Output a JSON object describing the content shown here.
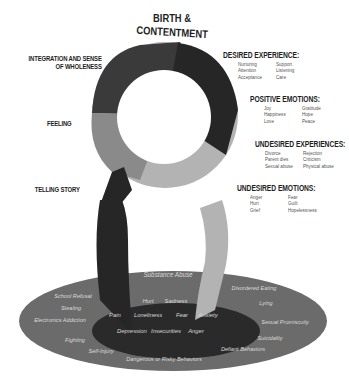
{
  "title": {
    "line1": "BIRTH &",
    "line2": "CONTENTMENT"
  },
  "left_labels": {
    "integration_line1": "INTEGRATION AND SENSE",
    "integration_line2": "OF WHOLENESS",
    "feeling": "FEELING",
    "telling_story": "TELLING STORY"
  },
  "sections": [
    {
      "heading": "DESIRED EXPERIENCE:",
      "items": [
        "Nurturing",
        "Support",
        "Attention",
        "Listening",
        "Acceptance",
        "Care"
      ]
    },
    {
      "heading": "POSITIVE EMOTIONS:",
      "items": [
        "Joy",
        "Gratitude",
        "Happiness",
        "Hope",
        "Love",
        "Peace"
      ]
    },
    {
      "heading": "UNDESIRED EXPERIENCES:",
      "items": [
        "Divorce",
        "Rejection",
        "Parent dies",
        "Criticism",
        "Sexual abuse",
        "Physical abuse"
      ]
    },
    {
      "heading": "UNDESIRED EMOTIONS:",
      "items": [
        "Anger",
        "Fear",
        "Hurt",
        "Guilt",
        "Grief",
        "Hopelessness"
      ]
    }
  ],
  "outer_ellipse": {
    "substance": "Substance Abuse",
    "left": [
      "School Refusal",
      "Stealing",
      "Electronics Addiction",
      "Fighting",
      "Self-Injury"
    ],
    "right": [
      "Disordered Eating",
      "Lying",
      "Sexual Promiscuity",
      "Suicidality",
      "Defiant Behaviors"
    ],
    "bottom": "Dangerous or Risky Behaviors"
  },
  "inner_ellipse": {
    "row1": [
      "Hurt",
      "Sadness"
    ],
    "row2": [
      "Pain",
      "Loneliness",
      "Fear",
      "Anxiety"
    ],
    "row3": [
      "Depression",
      "Insecurities",
      "Anger"
    ]
  },
  "colors": {
    "ring_dark": "#333333",
    "ring_darker": "#262626",
    "ring_mid": "#8a8a8a",
    "ring_light": "#b3b3b3",
    "outer_ellipse": "#6b6b6b",
    "inner_ellipse": "#2a2a2a",
    "ellipse_text": "#d9d9d9"
  }
}
